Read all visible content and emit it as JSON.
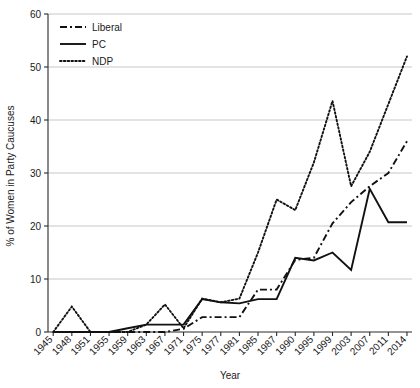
{
  "chart_data": {
    "type": "line",
    "title": "",
    "xlabel": "Year",
    "ylabel": "% of Women in Party Caucuses",
    "categories": [
      "1945",
      "1948",
      "1951",
      "1955",
      "1959",
      "1963",
      "1967",
      "1971",
      "1975",
      "1977",
      "1981",
      "1985",
      "1987",
      "1990",
      "1995",
      "1999",
      "2003",
      "2007",
      "2011",
      "2014"
    ],
    "ylim": [
      0,
      60
    ],
    "yticks": [
      0,
      10,
      20,
      30,
      40,
      50,
      60
    ],
    "grid": true,
    "legend_position": "top-left",
    "series": [
      {
        "name": "Liberal",
        "style": "dash-dot",
        "values": [
          0,
          0,
          0,
          0,
          0,
          0,
          0,
          0.6,
          2.8,
          2.8,
          2.8,
          8.0,
          8.0,
          13.6,
          14.0,
          20.5,
          24.5,
          27.5,
          30.0,
          36.0
        ]
      },
      {
        "name": "PC",
        "style": "solid",
        "values": [
          0,
          0,
          0,
          0,
          0.7,
          1.4,
          1.4,
          1.4,
          6.2,
          5.6,
          5.4,
          6.2,
          6.2,
          14.0,
          13.5,
          15.0,
          11.7,
          27.0,
          20.7,
          20.7
        ]
      },
      {
        "name": "NDP",
        "style": "dotted",
        "values": [
          0,
          4.8,
          0,
          0,
          0,
          1.4,
          5.2,
          0.7,
          6.3,
          5.6,
          6.3,
          15.0,
          25.0,
          23.0,
          32.0,
          43.6,
          27.5,
          34.0,
          43.0,
          52.0
        ]
      }
    ]
  },
  "legend": {
    "items": [
      {
        "label": "Liberal"
      },
      {
        "label": "PC"
      },
      {
        "label": "NDP"
      }
    ]
  }
}
